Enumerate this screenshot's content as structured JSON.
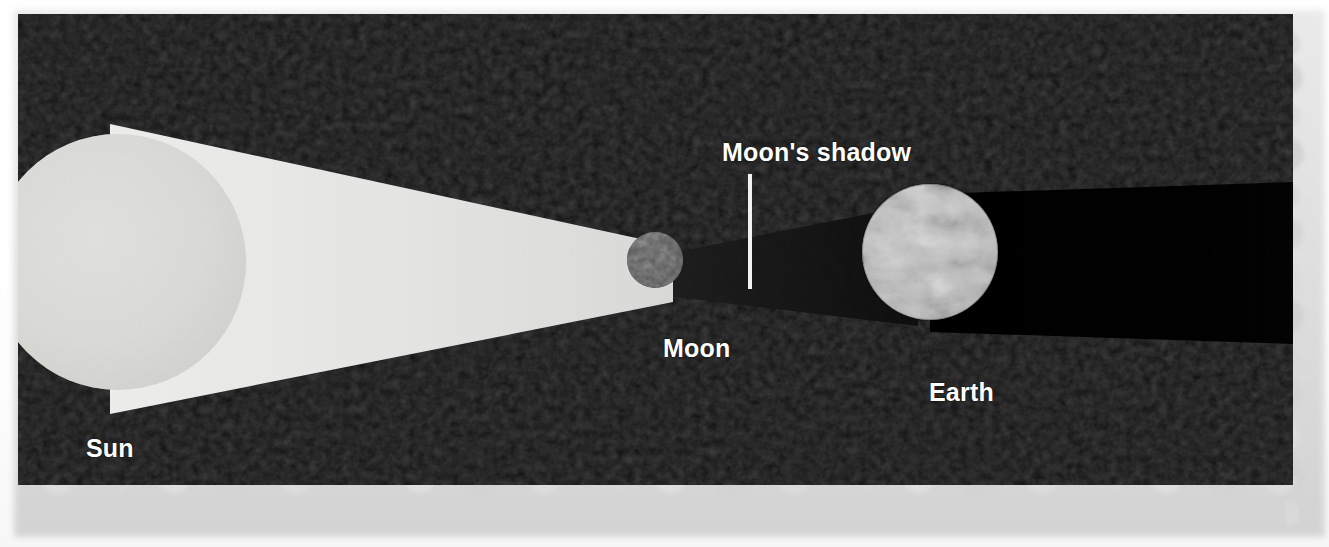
{
  "figure": {
    "kind": "solar-eclipse-diagram",
    "background_color": "#050505",
    "paper_color": "#ffffff"
  },
  "bodies": [
    {
      "name": "Sun",
      "label": "Sun",
      "role": "light-source",
      "center_x": 118,
      "center_y": 262,
      "radius": 128,
      "color": "#e8e8e6"
    },
    {
      "name": "Moon",
      "label": "Moon",
      "role": "occulter",
      "center_x": 655,
      "center_y": 260,
      "radius": 28,
      "color": "#4a4a4a"
    },
    {
      "name": "Earth",
      "label": "Earth",
      "role": "observer",
      "center_x": 930,
      "center_y": 252,
      "radius": 68,
      "color": "#b9b9b9"
    }
  ],
  "annotations": {
    "moons_shadow_label": "Moon's shadow",
    "leader_line_color": "#f2f2f2"
  },
  "beam": {
    "label": "sunlight-cone",
    "color": "#e2e2e0",
    "note": "converging cone of sunlight from Sun tangents to the Moon"
  },
  "shadow": {
    "label": "umbra-cone",
    "color": "#141414",
    "note": "Moon's shadow cone cast toward Earth; Earth's own shadow extends right"
  }
}
